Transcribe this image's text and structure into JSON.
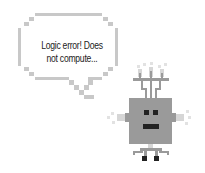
{
  "speech_bubble": {
    "line1": "Logic error! Does",
    "line2": "not compute..."
  },
  "illustration": {
    "subject": "pixel-art robot",
    "icon": "robot-icon",
    "colors": {
      "bubble_border": "#c8c8c8",
      "robot_body": "#9a9a9a",
      "robot_features": "#222222"
    }
  }
}
